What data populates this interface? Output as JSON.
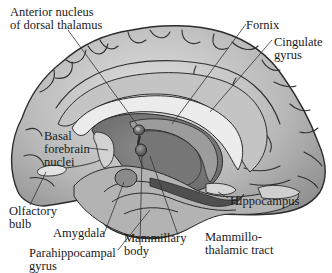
{
  "figure": {
    "colors": {
      "cortex": "#a9a9a9",
      "cortex_light": "#d8d8d8",
      "gyrus_band": "#bdbdbd",
      "corpus_callosum": "#e6e6e6",
      "deep_structures": "#7a7a7a",
      "dark_structures": "#555555",
      "outline": "#2b2b2b",
      "leader_line": "#3a3a3a"
    }
  },
  "labels": [
    {
      "id": "anterior-nucleus",
      "lines": [
        "Anterior nucleus",
        "of dorsal thalamus"
      ]
    },
    {
      "id": "fornix",
      "lines": [
        "Fornix"
      ]
    },
    {
      "id": "cingulate-gyrus",
      "lines": [
        "Cingulate",
        "gyrus"
      ]
    },
    {
      "id": "basal-forebrain-nuclei",
      "lines": [
        "Basal",
        "forebrain",
        "nuclei"
      ]
    },
    {
      "id": "olfactory-bulb",
      "lines": [
        "Olfactory",
        "bulb"
      ]
    },
    {
      "id": "hippocampus",
      "lines": [
        "Hippocampus"
      ]
    },
    {
      "id": "amygdala",
      "lines": [
        "Amygdala"
      ]
    },
    {
      "id": "mammillary-body",
      "lines": [
        "Mammillary",
        "body"
      ]
    },
    {
      "id": "mammillothalamic-tract",
      "lines": [
        "Mammillo-",
        "thalamic tract"
      ]
    },
    {
      "id": "parahippocampal-gyrus",
      "lines": [
        "Parahippocampal",
        "gyrus"
      ]
    }
  ],
  "text": {
    "anterior_nucleus": "Anterior nucleus\nof dorsal thalamus",
    "fornix": "Fornix",
    "cingulate_gyrus": "Cingulate\ngyrus",
    "basal_forebrain_nuclei": "Basal\nforebrain\nnuclei",
    "olfactory_bulb": "Olfactory\nbulb",
    "hippocampus": "Hippocampus",
    "amygdala": "Amygdala",
    "mammillary_body": "Mammillary\nbody",
    "mammillothalamic_tract": "Mammillo-\nthalamic tract",
    "parahippocampal_gyrus": "Parahippocampal\ngyrus"
  }
}
